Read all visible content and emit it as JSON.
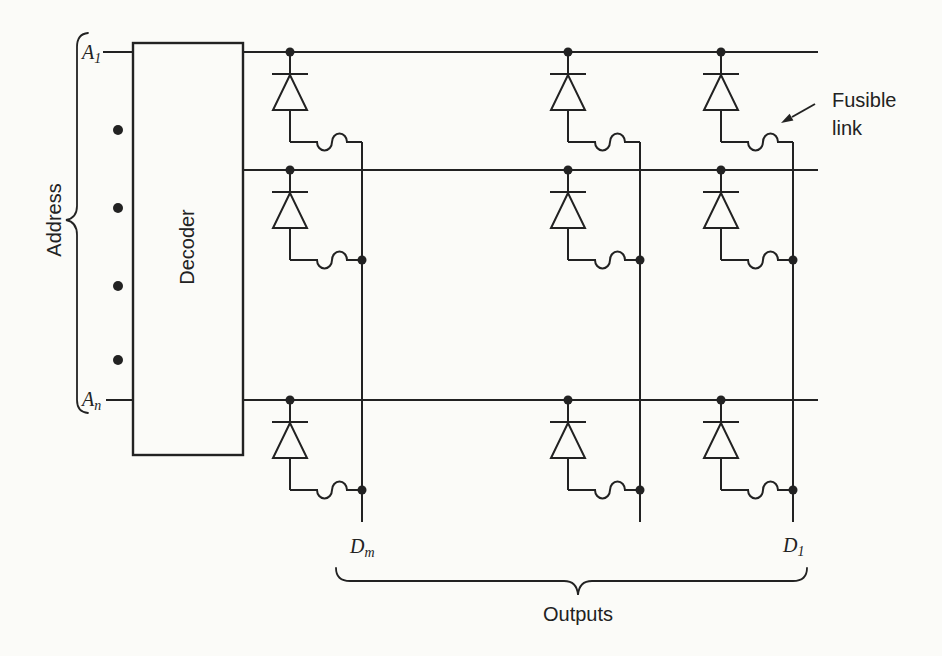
{
  "colors": {
    "ink": "#222222",
    "paper": "#fbfbf8"
  },
  "address_section": {
    "group_label": "Address",
    "top_input": {
      "base": "A",
      "subscript": "1"
    },
    "bottom_input": {
      "base": "A",
      "subscript": "n"
    },
    "ellipsis_dot_count": 4
  },
  "decoder": {
    "label": "Decoder"
  },
  "matrix": {
    "rows": 3,
    "columns": 3,
    "fusible_annotation": {
      "line1": "Fusible",
      "line2": "link"
    }
  },
  "outputs_section": {
    "group_label": "Outputs",
    "left_output": {
      "base": "D",
      "subscript": "m"
    },
    "right_output": {
      "base": "D",
      "subscript": "1"
    }
  },
  "icons": {
    "diode": "diode-icon",
    "fusible_link": "fusible-link-icon",
    "junction_dot": "junction-dot-icon",
    "ellipsis_dot": "ellipsis-dot-icon",
    "annotation_arrow": "arrow-icon",
    "address_brace": "curly-brace-icon",
    "outputs_brace": "curly-brace-icon"
  }
}
